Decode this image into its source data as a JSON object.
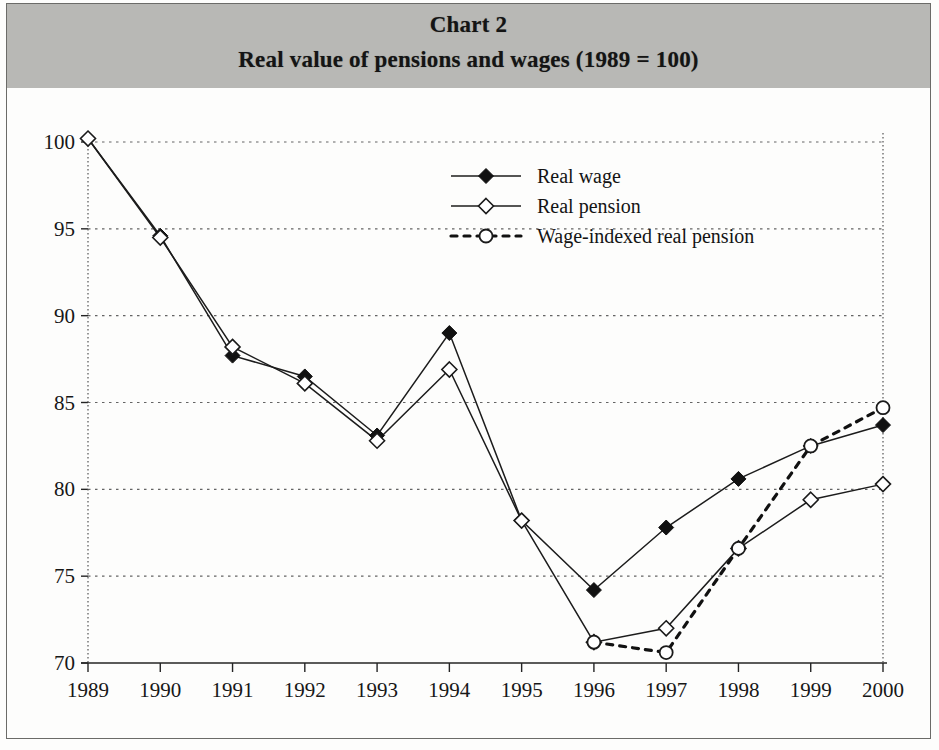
{
  "header": {
    "title": "Chart 2",
    "subtitle": "Real value of pensions and wages (1989 = 100)",
    "band_color": "#b8b8b5"
  },
  "chart_data": {
    "type": "line",
    "title": "Chart 2",
    "subtitle": "Real value of pensions and wages (1989 = 100)",
    "xlabel": "",
    "ylabel": "",
    "x": [
      1989,
      1990,
      1991,
      1992,
      1993,
      1994,
      1995,
      1996,
      1997,
      1998,
      1999,
      2000
    ],
    "xtick_labels": [
      "1989",
      "1990",
      "1991",
      "1992",
      "1993",
      "1994",
      "1995",
      "1996",
      "1997",
      "1998",
      "1999",
      "2000"
    ],
    "ytick_labels": [
      "70",
      "75",
      "80",
      "85",
      "90",
      "95",
      "100"
    ],
    "yticks": [
      70,
      75,
      80,
      85,
      90,
      95,
      100
    ],
    "ylim": [
      70,
      100
    ],
    "xlim": [
      1989,
      2000
    ],
    "grid": true,
    "grid_axis": "y",
    "legend_position": "upper-center",
    "series": [
      {
        "name": "Real wage",
        "marker": "filled-diamond",
        "line_style": "solid",
        "color": "#111111",
        "values": [
          100.2,
          94.6,
          87.7,
          86.5,
          83.1,
          89.0,
          78.2,
          74.2,
          77.8,
          80.6,
          82.5,
          83.7
        ]
      },
      {
        "name": "Real pension",
        "marker": "open-diamond",
        "line_style": "solid",
        "color": "#1a1a1a",
        "values": [
          100.2,
          94.5,
          88.2,
          86.1,
          82.8,
          86.9,
          78.2,
          71.2,
          72.0,
          76.6,
          79.4,
          80.3
        ]
      },
      {
        "name": "Wage-indexed real pension",
        "marker": "open-circle",
        "line_style": "dashed",
        "color": "#111111",
        "values": [
          null,
          null,
          null,
          null,
          null,
          null,
          null,
          71.2,
          70.6,
          76.6,
          82.5,
          84.7
        ]
      }
    ]
  }
}
